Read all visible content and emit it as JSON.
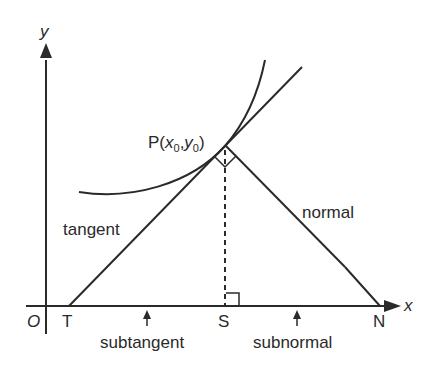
{
  "diagram": {
    "colors": {
      "line": "#2a2a2a",
      "background": "#ffffff"
    },
    "axes": {
      "x_label": "x",
      "y_label": "y",
      "origin_label": "O"
    },
    "point": {
      "label_prefix": "P(",
      "x_var": "x",
      "x_sub": "0",
      "comma": ",",
      "y_var": "y",
      "y_sub": "0",
      "label_suffix": ")"
    },
    "points": {
      "T": "T",
      "S": "S",
      "N": "N"
    },
    "lines": {
      "tangent": "tangent",
      "normal": "normal"
    },
    "segments": {
      "subtangent": "subtangent",
      "subnormal": "subnormal"
    }
  }
}
